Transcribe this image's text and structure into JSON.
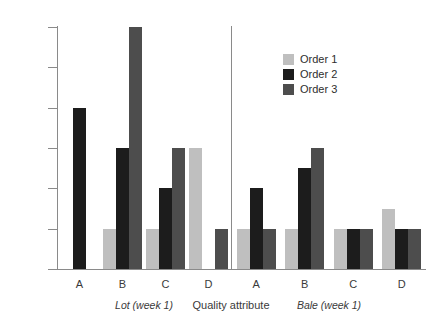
{
  "chart_data": {
    "type": "bar",
    "title": "",
    "xlabel": "Quality attribute",
    "ylabel": "",
    "ylim": [
      0.0,
      6.0
    ],
    "ytick_labels": [
      "0.0",
      "1.0",
      "2.0",
      "3.0",
      "4.0",
      "5.0",
      "6.0"
    ],
    "ytick_values": [
      0.0,
      1.0,
      2.0,
      3.0,
      4.0,
      5.0,
      6.0
    ],
    "grid": false,
    "legend_position": "top-right",
    "categories": [
      "A",
      "B",
      "C",
      "D"
    ],
    "panels": [
      {
        "label": "Lot (week 1)",
        "categories": [
          "A",
          "B",
          "C",
          "D"
        ],
        "series": [
          {
            "name": "Order 1",
            "color": "#bfbfbf",
            "values": [
              0,
              1.0,
              1.0,
              3.0
            ]
          },
          {
            "name": "Order 2",
            "color": "#1c1c1c",
            "values": [
              4.0,
              3.0,
              2.0,
              0
            ]
          },
          {
            "name": "Order 3",
            "color": "#4d4d4d",
            "values": [
              0,
              6.0,
              3.0,
              1.0
            ]
          }
        ]
      },
      {
        "label": "Bale (week 1)",
        "categories": [
          "A",
          "B",
          "C",
          "D"
        ],
        "series": [
          {
            "name": "Order 1",
            "color": "#bfbfbf",
            "values": [
              1.0,
              1.0,
              1.0,
              1.5
            ]
          },
          {
            "name": "Order 2",
            "color": "#1c1c1c",
            "values": [
              2.0,
              2.5,
              1.0,
              1.0
            ]
          },
          {
            "name": "Order 3",
            "color": "#4d4d4d",
            "values": [
              1.0,
              3.0,
              1.0,
              1.0
            ]
          }
        ]
      }
    ],
    "legend": [
      {
        "label": "Order 1",
        "color": "#bfbfbf"
      },
      {
        "label": "Order 2",
        "color": "#1c1c1c"
      },
      {
        "label": "Order 3",
        "color": "#4d4d4d"
      }
    ]
  }
}
